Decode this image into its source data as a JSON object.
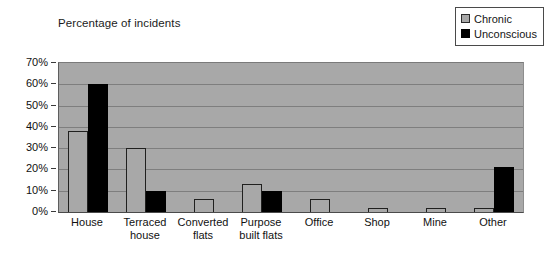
{
  "chart_data": {
    "type": "bar",
    "title": "Percentage of incidents",
    "xlabel": "",
    "ylabel": "",
    "ylim": [
      0,
      70
    ],
    "ytick_labels": [
      "70%",
      "60%",
      "50%",
      "40%",
      "30%",
      "20%",
      "10%",
      "0%"
    ],
    "ytick_values": [
      70,
      60,
      50,
      40,
      30,
      20,
      10,
      0
    ],
    "grid": true,
    "legend_position": "top-right",
    "categories": [
      "House",
      "Terraced house",
      "Converted flats",
      "Purpose built flats",
      "Office",
      "Shop",
      "Mine",
      "Other"
    ],
    "category_lines": [
      [
        "House"
      ],
      [
        "Terraced",
        "house"
      ],
      [
        "Converted",
        "flats"
      ],
      [
        "Purpose",
        "built flats"
      ],
      [
        "Office"
      ],
      [
        "Shop"
      ],
      [
        "Mine"
      ],
      [
        "Other"
      ]
    ],
    "series": [
      {
        "name": "Chronic",
        "color": "#a8a8a8",
        "values": [
          38,
          30,
          6,
          13,
          6,
          2,
          2,
          2
        ]
      },
      {
        "name": "Unconscious",
        "color": "#000000",
        "values": [
          60,
          10,
          0,
          10,
          0,
          0,
          0,
          21
        ]
      }
    ],
    "plot_background": "#a8a8a8",
    "gridline_color": "#7e7e7e"
  },
  "legend": {
    "items": [
      {
        "label": "Chronic",
        "swatch": "chronic"
      },
      {
        "label": "Unconscious",
        "swatch": "unconscious"
      }
    ]
  }
}
